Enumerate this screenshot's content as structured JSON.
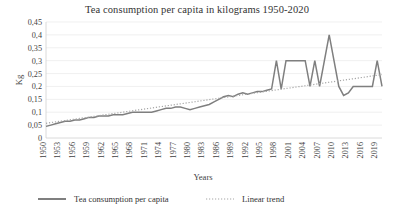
{
  "chart_data": {
    "type": "line",
    "title": "Tea consumption per capita in kilograms 1950-2020",
    "xlabel": "Years",
    "ylabel": "Kg",
    "ylim": [
      0,
      0.45
    ],
    "ytick_labels": [
      "0",
      "0,05",
      "0,1",
      "0,15",
      "0,2",
      "0,25",
      "0,3",
      "0,35",
      "0,4",
      "0,45"
    ],
    "ytick_values": [
      0,
      0.05,
      0.1,
      0.15,
      0.2,
      0.25,
      0.3,
      0.35,
      0.4,
      0.45
    ],
    "xtick_labels": [
      "1950",
      "1953",
      "1956",
      "1959",
      "1962",
      "1965",
      "1968",
      "1971",
      "1974",
      "1977",
      "1980",
      "1983",
      "1986",
      "1989",
      "1992",
      "1995",
      "1998",
      "2001",
      "2004",
      "2007",
      "2010",
      "2013",
      "2016",
      "2019"
    ],
    "xlim": [
      1950,
      2020
    ],
    "grid": true,
    "legend_position": "bottom",
    "decimal_separator": ",",
    "legend": [
      {
        "name": "Tea consumption per capita",
        "style": "solid",
        "color": "#7f7f7f"
      },
      {
        "name": "Linear trend",
        "style": "dotted",
        "color": "#a6a6a6"
      }
    ],
    "x": [
      1950,
      1951,
      1952,
      1953,
      1954,
      1955,
      1956,
      1957,
      1958,
      1959,
      1960,
      1961,
      1962,
      1963,
      1964,
      1965,
      1966,
      1967,
      1968,
      1969,
      1970,
      1971,
      1972,
      1973,
      1974,
      1975,
      1976,
      1977,
      1978,
      1979,
      1980,
      1981,
      1982,
      1983,
      1984,
      1985,
      1986,
      1987,
      1988,
      1989,
      1990,
      1991,
      1992,
      1993,
      1994,
      1995,
      1996,
      1997,
      1998,
      1999,
      2000,
      2001,
      2002,
      2003,
      2004,
      2005,
      2006,
      2007,
      2008,
      2009,
      2010,
      2011,
      2012,
      2013,
      2014,
      2015,
      2016,
      2017,
      2018,
      2019,
      2020
    ],
    "series": [
      {
        "name": "Tea consumption per capita",
        "style": "solid",
        "color": "#7f7f7f",
        "values": [
          0.045,
          0.05,
          0.055,
          0.06,
          0.065,
          0.065,
          0.07,
          0.07,
          0.075,
          0.08,
          0.08,
          0.085,
          0.085,
          0.085,
          0.09,
          0.09,
          0.09,
          0.095,
          0.1,
          0.1,
          0.1,
          0.1,
          0.1,
          0.105,
          0.11,
          0.115,
          0.115,
          0.12,
          0.12,
          0.115,
          0.11,
          0.115,
          0.12,
          0.125,
          0.13,
          0.14,
          0.15,
          0.16,
          0.165,
          0.16,
          0.17,
          0.175,
          0.17,
          0.175,
          0.18,
          0.18,
          0.185,
          0.19,
          0.3,
          0.19,
          0.3,
          0.3,
          0.3,
          0.3,
          0.3,
          0.2,
          0.3,
          0.2,
          0.3,
          0.4,
          0.3,
          0.2,
          0.165,
          0.175,
          0.2,
          0.2,
          0.2,
          0.2,
          0.2,
          0.3,
          0.2
        ]
      },
      {
        "name": "Linear trend",
        "style": "dotted",
        "color": "#a6a6a6",
        "values": [
          0.057,
          0.0597,
          0.0624,
          0.0651,
          0.0678,
          0.0705,
          0.0732,
          0.0759,
          0.0786,
          0.0813,
          0.084,
          0.0867,
          0.0894,
          0.0921,
          0.0948,
          0.0975,
          0.1002,
          0.1029,
          0.1056,
          0.1083,
          0.111,
          0.1137,
          0.1164,
          0.1191,
          0.1218,
          0.1245,
          0.1272,
          0.1299,
          0.1326,
          0.1353,
          0.138,
          0.1407,
          0.1434,
          0.1461,
          0.1488,
          0.1515,
          0.1542,
          0.1569,
          0.1596,
          0.1623,
          0.165,
          0.1677,
          0.1704,
          0.1731,
          0.1758,
          0.1785,
          0.1812,
          0.1839,
          0.1866,
          0.1893,
          0.192,
          0.1947,
          0.1974,
          0.2001,
          0.2028,
          0.2055,
          0.2082,
          0.2109,
          0.2136,
          0.2163,
          0.219,
          0.2217,
          0.2244,
          0.2271,
          0.2298,
          0.2325,
          0.2352,
          0.2379,
          0.2406,
          0.2433,
          0.246
        ]
      }
    ]
  }
}
